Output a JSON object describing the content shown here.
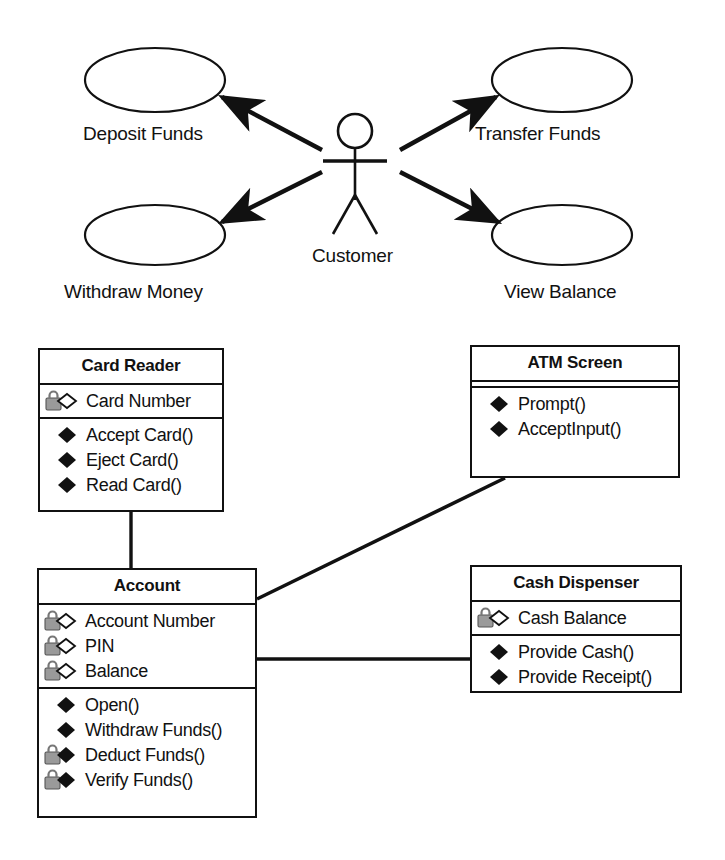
{
  "diagram": {
    "line_color": "#111111",
    "lock_color": "#9a9a9a",
    "fill_color": "#ffffff"
  },
  "use_case_diagram": {
    "actor": {
      "name": "customer-actor",
      "label": "Customer"
    },
    "use_cases": [
      {
        "id": "deposit-funds",
        "label": "Deposit Funds",
        "cx": 155,
        "cy": 80,
        "rx": 70,
        "ry": 32,
        "label_x": 83,
        "label_y": 123
      },
      {
        "id": "transfer-funds",
        "label": "Transfer Funds",
        "cx": 562,
        "cy": 80,
        "rx": 70,
        "ry": 32,
        "label_x": 475,
        "label_y": 123
      },
      {
        "id": "withdraw-money",
        "label": "Withdraw Money",
        "cx": 155,
        "cy": 235,
        "rx": 70,
        "ry": 30,
        "label_x": 64,
        "label_y": 281
      },
      {
        "id": "view-balance",
        "label": "View Balance",
        "cx": 562,
        "cy": 235,
        "rx": 70,
        "ry": 30,
        "label_x": 504,
        "label_y": 281
      }
    ],
    "associations": [
      {
        "id": "actor-to-deposit-funds",
        "from": "customer-actor",
        "to": "deposit-funds",
        "arrow": "to"
      },
      {
        "id": "actor-to-transfer-funds",
        "from": "customer-actor",
        "to": "transfer-funds",
        "arrow": "to"
      },
      {
        "id": "actor-to-withdraw-money",
        "from": "customer-actor",
        "to": "withdraw-money",
        "arrow": "to"
      },
      {
        "id": "actor-to-view-balance",
        "from": "customer-actor",
        "to": "view-balance",
        "arrow": "to"
      }
    ]
  },
  "class_diagram": {
    "classes": [
      {
        "id": "card-reader",
        "name": "Card Reader",
        "x": 38,
        "y": 348,
        "w": 186,
        "h": 164,
        "attributes": [
          {
            "label": "Card Number",
            "icon": "lock-diamond-hollow-icon",
            "visibility": "protected"
          }
        ],
        "methods": [
          {
            "label": "Accept Card()",
            "icon": "diamond-filled-icon",
            "visibility": "public"
          },
          {
            "label": "Eject Card()",
            "icon": "diamond-filled-icon",
            "visibility": "public"
          },
          {
            "label": "Read Card()",
            "icon": "diamond-filled-icon",
            "visibility": "public"
          }
        ]
      },
      {
        "id": "atm-screen",
        "name": "ATM Screen",
        "x": 470,
        "y": 345,
        "w": 210,
        "h": 133,
        "attributes": [],
        "methods": [
          {
            "label": "Prompt()",
            "icon": "diamond-filled-icon",
            "visibility": "public"
          },
          {
            "label": "AcceptInput()",
            "icon": "diamond-filled-icon",
            "visibility": "public"
          }
        ]
      },
      {
        "id": "account",
        "name": "Account",
        "x": 37,
        "y": 568,
        "w": 220,
        "h": 250,
        "attributes": [
          {
            "label": "Account Number",
            "icon": "lock-diamond-hollow-icon",
            "visibility": "protected"
          },
          {
            "label": "PIN",
            "icon": "lock-diamond-hollow-icon",
            "visibility": "protected"
          },
          {
            "label": "Balance",
            "icon": "lock-diamond-hollow-icon",
            "visibility": "protected"
          }
        ],
        "methods": [
          {
            "label": "Open()",
            "icon": "diamond-filled-icon",
            "visibility": "public"
          },
          {
            "label": "Withdraw Funds()",
            "icon": "diamond-filled-icon",
            "visibility": "public"
          },
          {
            "label": "Deduct Funds()",
            "icon": "lock-diamond-filled-icon",
            "visibility": "protected"
          },
          {
            "label": "Verify Funds()",
            "icon": "lock-diamond-filled-icon",
            "visibility": "protected"
          }
        ]
      },
      {
        "id": "cash-dispenser",
        "name": "Cash Dispenser",
        "x": 470,
        "y": 565,
        "w": 212,
        "h": 128,
        "attributes": [
          {
            "label": "Cash Balance",
            "icon": "lock-diamond-hollow-icon",
            "visibility": "protected"
          }
        ],
        "methods": [
          {
            "label": "Provide Cash()",
            "icon": "diamond-filled-icon",
            "visibility": "public"
          },
          {
            "label": "Provide Receipt()",
            "icon": "diamond-filled-icon",
            "visibility": "public"
          }
        ]
      }
    ],
    "associations": [
      {
        "id": "card-reader-to-account",
        "from": "card-reader",
        "to": "account",
        "kind": "association",
        "path": "M 131,512 L 131,568"
      },
      {
        "id": "account-to-atm-screen",
        "from": "account",
        "to": "atm-screen",
        "kind": "association",
        "path": "M 257,599 L 502,478"
      },
      {
        "id": "account-to-cash-dispenser",
        "from": "account",
        "to": "cash-dispenser",
        "kind": "association",
        "path": "M 257,659 L 470,659"
      }
    ]
  },
  "legend": {
    "icons": {
      "diamond-filled-icon": "public operation",
      "lock-diamond-hollow-icon": "protected attribute",
      "lock-diamond-filled-icon": "protected operation",
      "actor-icon": "stick figure actor",
      "ellipse-icon": "use case oval"
    }
  }
}
